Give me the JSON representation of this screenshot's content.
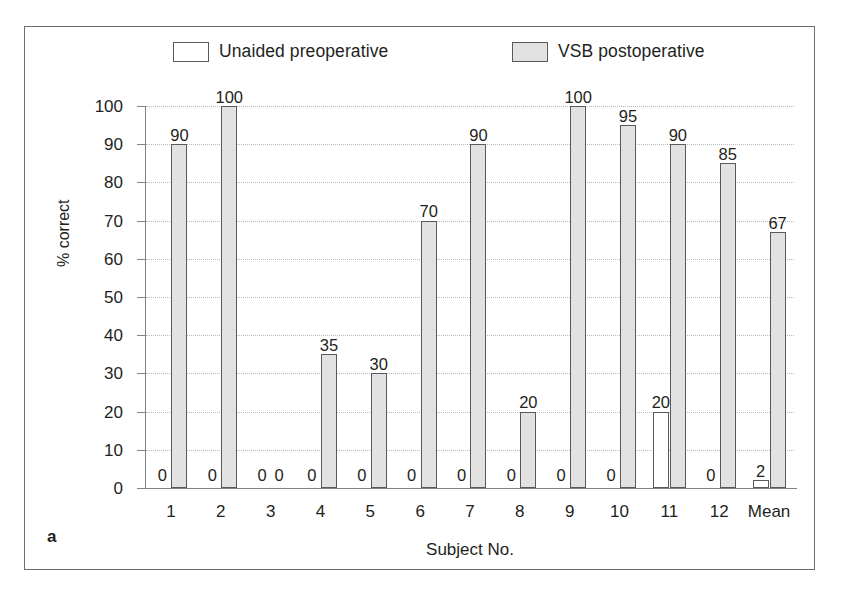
{
  "figure": {
    "panel_label": "a"
  },
  "legend": {
    "position": "top",
    "items": [
      {
        "label": "Unaided preoperative",
        "swatch": "white-outlined-rectangle",
        "color": "#ffffff"
      },
      {
        "label": "VSB postoperative",
        "swatch": "gray-filled-rectangle",
        "color": "#e2e2e2"
      }
    ]
  },
  "chart_data": {
    "type": "bar",
    "title": "",
    "xlabel": "Subject No.",
    "ylabel": "% correct",
    "ylim": [
      0,
      100
    ],
    "ytick_step": 10,
    "yticks": [
      100,
      90,
      80,
      70,
      60,
      50,
      40,
      30,
      20,
      10,
      0
    ],
    "grid": true,
    "legend_position": "top",
    "categories": [
      "1",
      "2",
      "3",
      "4",
      "5",
      "6",
      "7",
      "8",
      "9",
      "10",
      "11",
      "12",
      "Mean"
    ],
    "series": [
      {
        "name": "Unaided preoperative",
        "color": "#ffffff",
        "values": [
          0,
          0,
          0,
          0,
          0,
          0,
          0,
          0,
          0,
          0,
          20,
          0,
          2
        ],
        "labels": [
          "0",
          "0",
          "0",
          "0",
          "0",
          "0",
          "0",
          "0",
          "0",
          "0",
          "20",
          "0",
          "2"
        ]
      },
      {
        "name": "VSB postoperative",
        "color": "#e2e2e2",
        "values": [
          90,
          100,
          0,
          35,
          30,
          70,
          90,
          20,
          100,
          95,
          90,
          85,
          67
        ],
        "labels": [
          "90",
          "100",
          "0",
          "35",
          "30",
          "70",
          "90",
          "20",
          "100",
          "95",
          "90",
          "85",
          "67"
        ]
      }
    ]
  }
}
